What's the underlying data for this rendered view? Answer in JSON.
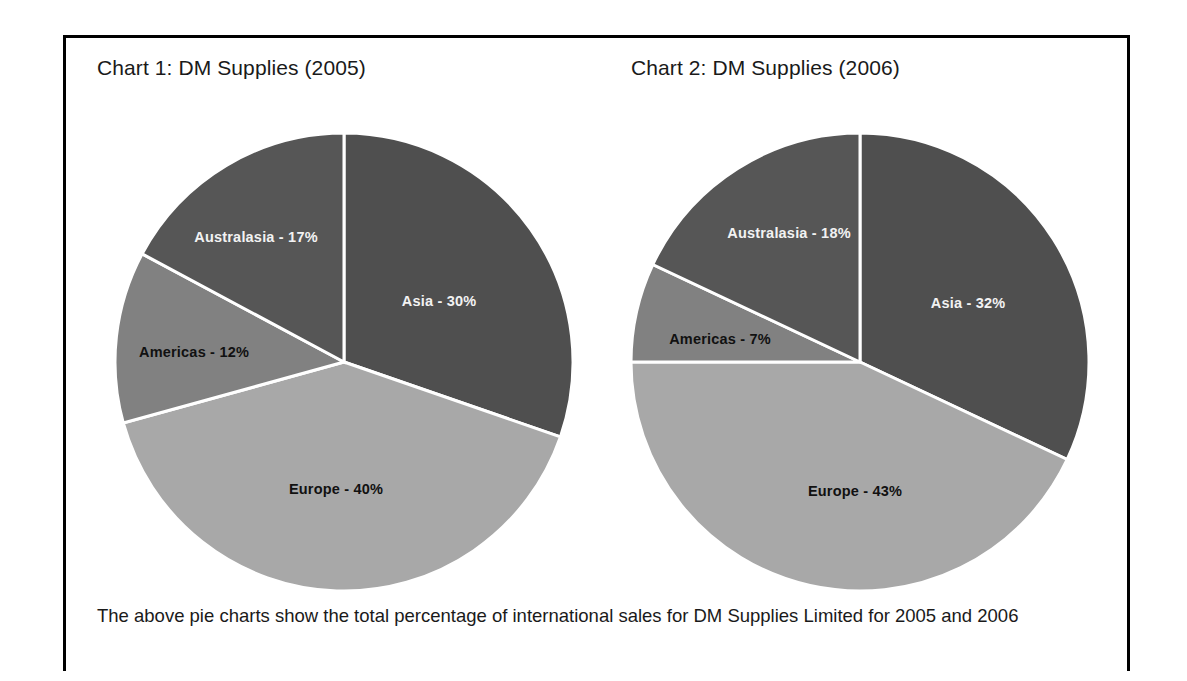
{
  "figure": {
    "caption": "The above pie charts show the total percentage of international sales for DM Supplies Limited for 2005 and 2006"
  },
  "chart_data": [
    {
      "type": "pie",
      "title": "Chart 1: DM Supplies (2005)",
      "categories": [
        "Asia",
        "Europe",
        "Americas",
        "Australasia"
      ],
      "values": [
        30,
        40,
        12,
        17
      ],
      "unit": "%",
      "start_angle_deg": 0,
      "direction": "clockwise",
      "slices": [
        {
          "label": "Asia - 30%",
          "name": "Asia",
          "value": 30,
          "color": "#4f4f4f",
          "label_fill": "light",
          "label_x": 95,
          "label_y": -60
        },
        {
          "label": "Europe - 40%",
          "name": "Europe",
          "value": 40,
          "color": "#a8a8a8",
          "label_fill": "dark",
          "label_x": -8,
          "label_y": 128
        },
        {
          "label": "Americas - 12%",
          "name": "Americas",
          "value": 12,
          "color": "#818181",
          "label_fill": "dark",
          "label_x": -150,
          "label_y": -9
        },
        {
          "label": "Australasia - 17%",
          "name": "Australasia",
          "value": 17,
          "color": "#565656",
          "label_fill": "light",
          "label_x": -88,
          "label_y": -124
        }
      ],
      "legend_position": "inside-slices",
      "grid": false
    },
    {
      "type": "pie",
      "title": "Chart 2: DM Supplies (2006)",
      "categories": [
        "Asia",
        "Europe",
        "Americas",
        "Australasia"
      ],
      "values": [
        32,
        43,
        7,
        18
      ],
      "unit": "%",
      "start_angle_deg": 0,
      "direction": "clockwise",
      "slices": [
        {
          "label": "Asia - 32%",
          "name": "Asia",
          "value": 32,
          "color": "#4f4f4f",
          "label_fill": "light",
          "label_x": 108,
          "label_y": -58
        },
        {
          "label": "Europe - 43%",
          "name": "Europe",
          "value": 43,
          "color": "#a8a8a8",
          "label_fill": "dark",
          "label_x": -5,
          "label_y": 130
        },
        {
          "label": "Americas - 7%",
          "name": "Americas",
          "value": 7,
          "color": "#818181",
          "label_fill": "dark",
          "label_x": -140,
          "label_y": -22
        },
        {
          "label": "Australasia - 18%",
          "name": "Australasia",
          "value": 18,
          "color": "#565656",
          "label_fill": "light",
          "label_x": -71,
          "label_y": -128
        }
      ],
      "legend_position": "inside-slices",
      "grid": false
    }
  ]
}
